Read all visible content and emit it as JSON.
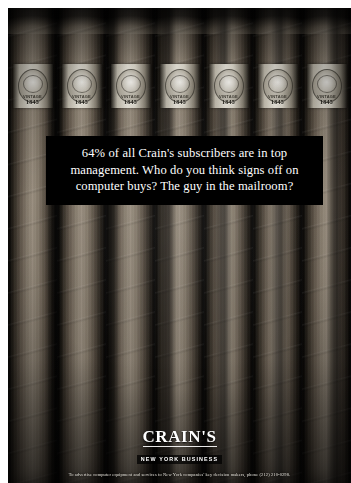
{
  "ad": {
    "headline": "64% of all Crain's subscribers are in top management. Who do you think signs off on computer buys? The guy in the mailroom?",
    "fine_print": "To advertise computer equipment and services to New York companies' key decision makers, phone (212) 210-0298."
  },
  "logo": {
    "wordmark": "CRAIN'S",
    "tagline": "NEW YORK BUSINESS"
  },
  "cigar_bands": {
    "brand": "VINTAGE",
    "year": "1845",
    "count": 7
  },
  "colors": {
    "page_background": "#ffffff",
    "headline_panel": "#000000",
    "headline_text": "#ffffff",
    "tobacco_light": "#9a8f80",
    "tobacco_dark": "#0b0a08",
    "band_paper": "#ecE9df"
  }
}
